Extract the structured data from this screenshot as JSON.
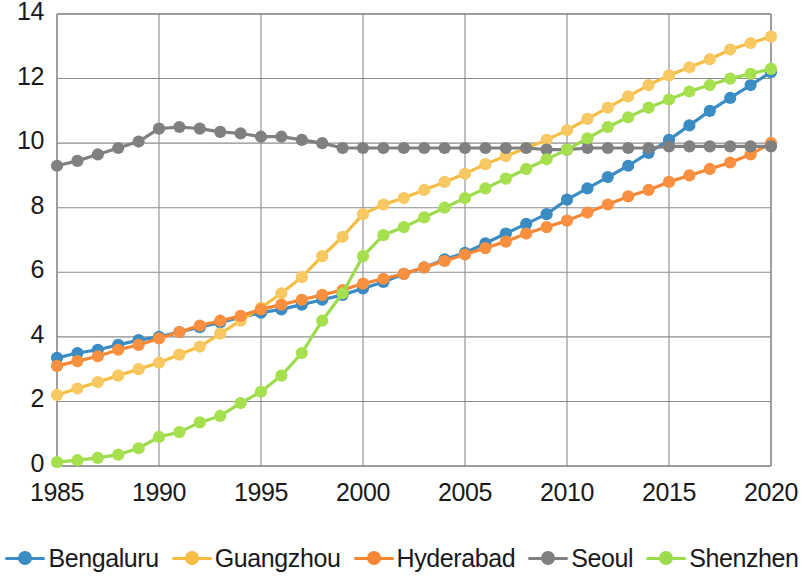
{
  "chart_data": {
    "type": "line",
    "title": "",
    "xlabel": "",
    "ylabel": "",
    "xlim": [
      1985,
      2020
    ],
    "ylim": [
      0,
      14
    ],
    "grid": true,
    "legend_position": "bottom",
    "x_ticks": [
      "1985",
      "1990",
      "1995",
      "2000",
      "2005",
      "2010",
      "2015",
      "2020"
    ],
    "y_ticks": [
      "0",
      "2",
      "4",
      "6",
      "8",
      "10",
      "12",
      "14"
    ],
    "x": [
      1985,
      1986,
      1987,
      1988,
      1989,
      1990,
      1991,
      1992,
      1993,
      1994,
      1995,
      1996,
      1997,
      1998,
      1999,
      2000,
      2001,
      2002,
      2003,
      2004,
      2005,
      2006,
      2007,
      2008,
      2009,
      2010,
      2011,
      2012,
      2013,
      2014,
      2015,
      2016,
      2017,
      2018,
      2019,
      2020
    ],
    "series": [
      {
        "name": "Bengaluru",
        "color": "#3C8CC4",
        "marker_color": "#3C8CC4",
        "values": [
          3.35,
          3.5,
          3.6,
          3.75,
          3.9,
          4.0,
          4.15,
          4.3,
          4.45,
          4.6,
          4.75,
          4.85,
          5.0,
          5.15,
          5.3,
          5.5,
          5.7,
          5.95,
          6.15,
          6.4,
          6.6,
          6.9,
          7.2,
          7.5,
          7.8,
          8.25,
          8.6,
          8.95,
          9.3,
          9.7,
          10.1,
          10.55,
          11.0,
          11.4,
          11.8,
          12.2
        ]
      },
      {
        "name": "Guangzhou",
        "color": "#F5BD42",
        "marker_color": "#F8C862",
        "values": [
          2.2,
          2.4,
          2.6,
          2.8,
          3.0,
          3.2,
          3.45,
          3.7,
          4.1,
          4.5,
          4.9,
          5.35,
          5.85,
          6.5,
          7.1,
          7.8,
          8.1,
          8.3,
          8.55,
          8.8,
          9.05,
          9.35,
          9.6,
          9.85,
          10.1,
          10.4,
          10.75,
          11.1,
          11.45,
          11.8,
          12.1,
          12.35,
          12.6,
          12.9,
          13.1,
          13.3
        ]
      },
      {
        "name": "Hyderabad",
        "color": "#F58634",
        "marker_color": "#F89040",
        "values": [
          3.1,
          3.25,
          3.4,
          3.6,
          3.75,
          3.95,
          4.15,
          4.35,
          4.5,
          4.65,
          4.85,
          5.0,
          5.15,
          5.3,
          5.45,
          5.65,
          5.8,
          5.95,
          6.15,
          6.35,
          6.55,
          6.75,
          6.95,
          7.2,
          7.4,
          7.6,
          7.85,
          8.1,
          8.35,
          8.55,
          8.8,
          9.0,
          9.2,
          9.4,
          9.65,
          10.0
        ]
      },
      {
        "name": "Seoul",
        "color": "#808080",
        "marker_color": "#808080",
        "values": [
          9.3,
          9.45,
          9.65,
          9.85,
          10.05,
          10.45,
          10.5,
          10.45,
          10.35,
          10.3,
          10.2,
          10.2,
          10.1,
          10.0,
          9.85,
          9.85,
          9.85,
          9.85,
          9.85,
          9.85,
          9.85,
          9.85,
          9.85,
          9.85,
          9.8,
          9.8,
          9.85,
          9.85,
          9.85,
          9.85,
          9.9,
          9.9,
          9.9,
          9.9,
          9.9,
          9.9
        ]
      },
      {
        "name": "Shenzhen",
        "color": "#9BDB4C",
        "marker_color": "#A6E04F",
        "values": [
          0.12,
          0.18,
          0.25,
          0.35,
          0.55,
          0.9,
          1.05,
          1.35,
          1.55,
          1.95,
          2.3,
          2.8,
          3.5,
          4.5,
          5.35,
          6.5,
          7.15,
          7.4,
          7.7,
          8.0,
          8.3,
          8.6,
          8.9,
          9.2,
          9.5,
          9.8,
          10.15,
          10.5,
          10.8,
          11.1,
          11.35,
          11.6,
          11.8,
          12.0,
          12.15,
          12.3
        ]
      }
    ]
  },
  "legend": {
    "items": [
      {
        "label": "Bengaluru",
        "color": "#3C8CC4"
      },
      {
        "label": "Guangzhou",
        "color": "#F5BD42"
      },
      {
        "label": "Hyderabad",
        "color": "#F58634"
      },
      {
        "label": "Seoul",
        "color": "#808080"
      },
      {
        "label": "Shenzhen",
        "color": "#9BDB4C"
      }
    ]
  },
  "axes": {
    "grid_color": "#8c8c8c",
    "axis_color": "#8c8c8c",
    "text_color": "#1a1a1a"
  }
}
